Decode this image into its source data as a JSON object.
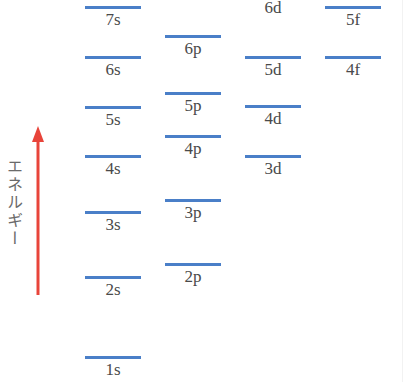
{
  "diagram": {
    "title": "",
    "axis_label": "エネルギー",
    "colors": {
      "level_line": "#4a7fc8",
      "arrow": "#e8443a",
      "label_text": "#4a4a4a"
    },
    "columns": [
      "s",
      "p",
      "d",
      "f"
    ],
    "levels": {
      "s7": "7s",
      "s6": "6s",
      "s5": "5s",
      "s4": "4s",
      "s3": "3s",
      "s2": "2s",
      "s1": "1s",
      "p6": "6p",
      "p5": "5p",
      "p4": "4p",
      "p3": "3p",
      "p2": "2p",
      "d6": "6d",
      "d5": "5d",
      "d4": "4d",
      "d3": "3d",
      "f5": "5f",
      "f4": "4f"
    }
  }
}
